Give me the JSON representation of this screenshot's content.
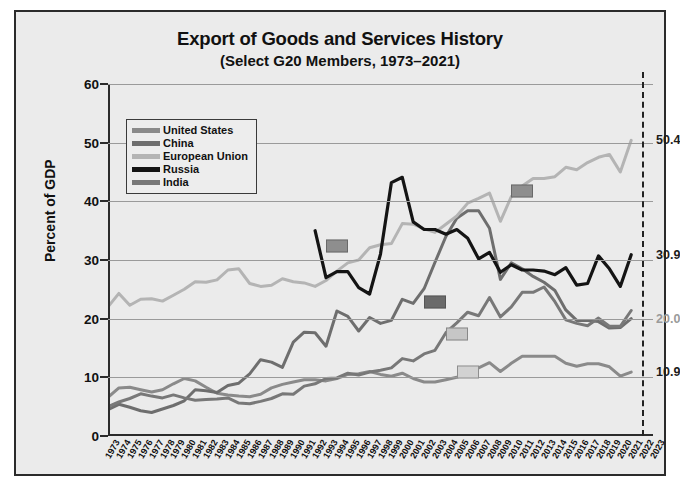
{
  "chart_data": {
    "type": "line",
    "title": "Export of Goods and Services History",
    "subtitle": "(Select G20 Members, 1973–2021)",
    "xlabel": "",
    "ylabel": "Percent of GDP",
    "ylim": [
      0,
      60
    ],
    "yticks": [
      0,
      10,
      20,
      30,
      40,
      50,
      60
    ],
    "grid": true,
    "legend_position": "top-left",
    "x": [
      1973,
      1974,
      1975,
      1976,
      1977,
      1978,
      1979,
      1980,
      1981,
      1982,
      1983,
      1984,
      1985,
      1986,
      1987,
      1988,
      1989,
      1990,
      1991,
      1992,
      1993,
      1994,
      1995,
      1996,
      1997,
      1998,
      1999,
      2000,
      2001,
      2002,
      2003,
      2004,
      2005,
      2006,
      2007,
      2008,
      2009,
      2010,
      2011,
      2012,
      2013,
      2014,
      2015,
      2016,
      2017,
      2018,
      2019,
      2020,
      2021,
      2022,
      2023
    ],
    "xticks": [
      "1973",
      "1974",
      "1975",
      "1976",
      "1977",
      "1978",
      "1979",
      "1980",
      "1981",
      "1982",
      "1983",
      "1984",
      "1985",
      "1986",
      "1987",
      "1988",
      "1989",
      "1990",
      "1991",
      "1992",
      "1993",
      "1994",
      "1995",
      "1996",
      "1997",
      "1998",
      "1999",
      "2000",
      "2001",
      "2002",
      "2003",
      "2004",
      "2005",
      "2006",
      "2007",
      "2008",
      "2009",
      "2010",
      "2011",
      "2012",
      "2013",
      "2014",
      "2015",
      "2016",
      "2017",
      "2018",
      "2019",
      "2020",
      "2021",
      "2022",
      "2023"
    ],
    "series": [
      {
        "name": "United States",
        "color": "#8a8a8a",
        "end_value": 10.9,
        "end_label": "10.9",
        "values": [
          6.6,
          8.2,
          8.3,
          7.9,
          7.5,
          7.9,
          8.9,
          9.8,
          9.4,
          8.3,
          7.3,
          7.0,
          6.8,
          6.7,
          7.1,
          8.2,
          8.8,
          9.2,
          9.6,
          9.6,
          9.4,
          9.8,
          10.5,
          10.6,
          11.0,
          10.5,
          10.2,
          10.7,
          9.8,
          9.2,
          9.2,
          9.6,
          10.0,
          10.7,
          11.6,
          12.5,
          11.0,
          12.4,
          13.6,
          13.6,
          13.6,
          13.6,
          12.4,
          11.9,
          12.3,
          12.3,
          11.8,
          10.2,
          10.9,
          null,
          null
        ]
      },
      {
        "name": "China",
        "color": "#6e6e6e",
        "end_value": 20.0,
        "end_label": "20.0",
        "values": [
          4.5,
          5.4,
          4.9,
          4.3,
          4.0,
          4.6,
          5.2,
          6.0,
          7.9,
          7.7,
          7.4,
          8.6,
          9.0,
          10.6,
          13.0,
          12.6,
          11.7,
          16.0,
          17.7,
          17.6,
          15.3,
          21.3,
          20.4,
          17.9,
          20.2,
          19.2,
          19.7,
          23.3,
          22.6,
          25.1,
          29.6,
          34.0,
          37.1,
          38.4,
          38.4,
          35.4,
          26.7,
          29.5,
          28.5,
          27.2,
          26.2,
          24.8,
          21.5,
          19.7,
          19.7,
          19.5,
          18.4,
          18.5,
          20.0,
          null,
          null
        ]
      },
      {
        "name": "European Union",
        "color": "#b4b4b4",
        "end_value": 50.4,
        "end_label": "50.4",
        "values": [
          22.0,
          24.3,
          22.3,
          23.3,
          23.4,
          23.0,
          24.0,
          25.0,
          26.3,
          26.2,
          26.6,
          28.3,
          28.5,
          26.0,
          25.5,
          25.7,
          26.8,
          26.3,
          26.1,
          25.5,
          26.5,
          28.1,
          29.5,
          30.0,
          32.1,
          32.6,
          32.8,
          36.2,
          36.1,
          35.3,
          34.7,
          36.1,
          37.5,
          39.7,
          40.5,
          41.4,
          36.6,
          40.8,
          42.6,
          43.9,
          43.9,
          44.2,
          45.8,
          45.4,
          46.6,
          47.5,
          48.0,
          45.0,
          50.4,
          null,
          null
        ]
      },
      {
        "name": "Russia",
        "color": "#141414",
        "end_value": 30.9,
        "end_label": "30.9",
        "values": [
          null,
          null,
          null,
          null,
          null,
          null,
          null,
          null,
          null,
          null,
          null,
          null,
          null,
          null,
          null,
          null,
          null,
          null,
          null,
          35.0,
          27.0,
          28.0,
          28.0,
          25.3,
          24.2,
          31.0,
          43.2,
          44.1,
          36.5,
          35.2,
          35.2,
          34.4,
          35.2,
          33.7,
          30.2,
          31.3,
          27.9,
          29.2,
          28.3,
          28.3,
          28.1,
          27.5,
          28.7,
          25.7,
          26.0,
          30.7,
          28.5,
          25.5,
          30.9,
          null,
          null
        ]
      },
      {
        "name": "India",
        "color": "#787878",
        "end_value": 10.9,
        "end_label": "10.9",
        "values": [
          5.0,
          5.8,
          6.4,
          7.2,
          6.8,
          6.5,
          7.0,
          6.5,
          6.1,
          6.2,
          6.3,
          6.5,
          5.6,
          5.5,
          5.9,
          6.4,
          7.2,
          7.1,
          8.5,
          8.9,
          9.8,
          9.9,
          10.7,
          10.4,
          10.9,
          11.2,
          11.6,
          13.2,
          12.8,
          14.0,
          14.6,
          17.6,
          19.3,
          21.1,
          20.5,
          23.6,
          20.3,
          22.0,
          24.5,
          24.5,
          25.4,
          22.9,
          19.8,
          19.2,
          18.8,
          20.1,
          18.7,
          18.7,
          21.4,
          null,
          null
        ]
      }
    ],
    "markers": [
      {
        "series": "Russia",
        "year": 1994,
        "value": 32.4,
        "color": "#8e8e8e"
      },
      {
        "series": "China",
        "year": 2003,
        "value": 22.8,
        "color": "#6a6a6a"
      },
      {
        "series": "United States",
        "year": 2005,
        "value": 17.4,
        "color": "#c6c6c6"
      },
      {
        "series": "India",
        "year": 2006,
        "value": 10.9,
        "color": "#d2d2d2"
      },
      {
        "series": "European Union",
        "year": 2011,
        "value": 41.8,
        "color": "#8e8e8e"
      }
    ],
    "reference_line": {
      "year": 2022,
      "style": "dashed",
      "color": "#222222"
    },
    "end_labels": [
      {
        "text": "50.4",
        "value": 50.4,
        "color": "#1c1c1c"
      },
      {
        "text": "30.9",
        "value": 30.9,
        "color": "#1c1c1c"
      },
      {
        "text": "20.0",
        "value": 20.0,
        "color": "#9a9a9a"
      },
      {
        "text": "10.9",
        "value": 10.9,
        "color": "#1c1c1c"
      }
    ]
  },
  "legend": {
    "items": [
      {
        "label": "United States",
        "color": "#8a8a8a"
      },
      {
        "label": "China",
        "color": "#6e6e6e"
      },
      {
        "label": "European Union",
        "color": "#b4b4b4"
      },
      {
        "label": "Russia",
        "color": "#141414"
      },
      {
        "label": "India",
        "color": "#787878"
      }
    ]
  }
}
